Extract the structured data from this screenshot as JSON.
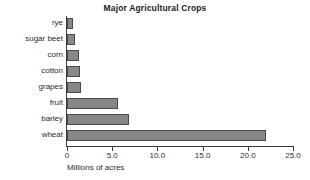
{
  "chart_data": {
    "type": "bar",
    "orientation": "horizontal",
    "title": "Major Agricultural Crops",
    "xlabel": "Millions of acres",
    "ylabel": "",
    "categories": [
      "rye",
      "sugar beet",
      "corn",
      "cotton",
      "grapes",
      "fruit",
      "barley",
      "wheat"
    ],
    "values": [
      0.7,
      0.9,
      1.3,
      1.4,
      1.6,
      5.6,
      6.9,
      22.0
    ],
    "xlim": [
      0,
      25
    ],
    "xticks": [
      0,
      5,
      10,
      15,
      20,
      25
    ],
    "xtick_labels": [
      "0",
      "5.0",
      "10.0",
      "15.0",
      "20.0",
      "25.0"
    ],
    "grid": false,
    "legend": false,
    "bar_color": "#878787",
    "bar_edge_color": "#4a4a4a",
    "axis_color": "#3a3a3a",
    "background_color": "#ffffff"
  }
}
